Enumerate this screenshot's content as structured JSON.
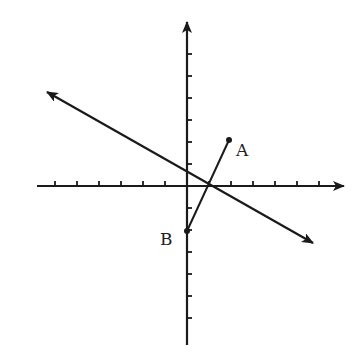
{
  "diagram": {
    "type": "coordinate-plane",
    "unit_px": 22,
    "origin_px": [
      187,
      186
    ],
    "colors": {
      "ink": "#1a1a1a",
      "label": "#222222",
      "background": "#ffffff"
    },
    "x_axis": {
      "from_px": 37,
      "to_px": 344,
      "ticks_left": 6,
      "ticks_right": 6,
      "arrow": "right"
    },
    "y_axis": {
      "from_px": 345,
      "to_px": 22,
      "ticks_up": 6,
      "ticks_down": 6,
      "arrow": "up"
    },
    "line": {
      "description": "line with arrows at both ends, negative slope",
      "from_px": [
        47,
        92
      ],
      "to_px": [
        313,
        243
      ]
    },
    "segment_AB": {
      "A": {
        "label": "A",
        "coord": [
          2,
          2
        ],
        "px": [
          229,
          140
        ]
      },
      "B": {
        "label": "B",
        "coord": [
          0,
          -2
        ],
        "px": [
          187,
          231
        ]
      }
    }
  },
  "labels": {
    "point_a": "A",
    "point_b": "B"
  }
}
